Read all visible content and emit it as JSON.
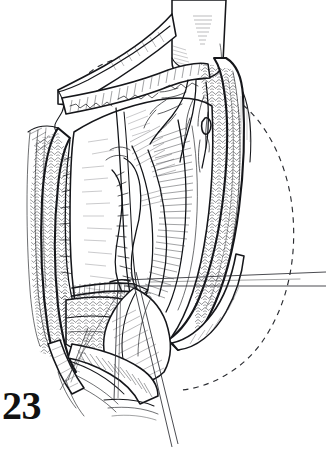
{
  "figure": {
    "number_label": "23",
    "caption": "",
    "medium": "pen-and-ink line drawing",
    "background_color": "#ffffff",
    "ink_color": "#15161a",
    "width": 326,
    "height": 465
  },
  "annotations": {
    "dashed_outline_right_label": "",
    "dashed_outline_upper_left_label": ""
  },
  "elements": {
    "tubular_structure_label": "",
    "left_tissue_flap_label": "",
    "right_tissue_flap_label": "",
    "suture_line_label": "",
    "instrument_label": "",
    "vessel_group_label": ""
  }
}
